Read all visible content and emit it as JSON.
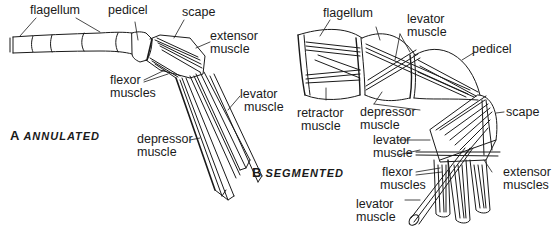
{
  "figure": {
    "panels": [
      {
        "id": "A",
        "letter": "A",
        "title": "ANNULATED",
        "labels": {
          "flagellum": "flagellum",
          "pedicel": "pedicel",
          "scape": "scape",
          "extensor_1": "extensor",
          "extensor_2": "muscle",
          "flexor_1": "flexor",
          "flexor_2": "muscles",
          "levator_1": "levator",
          "levator_2": "muscle",
          "depressor_1": "depressor",
          "depressor_2": "muscle"
        }
      },
      {
        "id": "B",
        "letter": "B",
        "title": "SEGMENTED",
        "labels": {
          "flagellum": "flagellum",
          "levator_top_1": "levator",
          "levator_top_2": "muscle",
          "pedicel": "pedicel",
          "retractor_1": "retractor",
          "retractor_2": "muscle",
          "depressor_1": "depressor",
          "depressor_2": "muscle",
          "scape": "scape",
          "levator_mid_1": "levator",
          "levator_mid_2": "muscle",
          "flexor_1": "flexor",
          "flexor_2": "muscles",
          "extensor_1": "extensor",
          "extensor_2": "muscles",
          "levator_bot_1": "levator",
          "levator_bot_2": "muscle"
        }
      }
    ],
    "colors": {
      "ink": "#1a1a1a",
      "background": "#ffffff"
    }
  }
}
